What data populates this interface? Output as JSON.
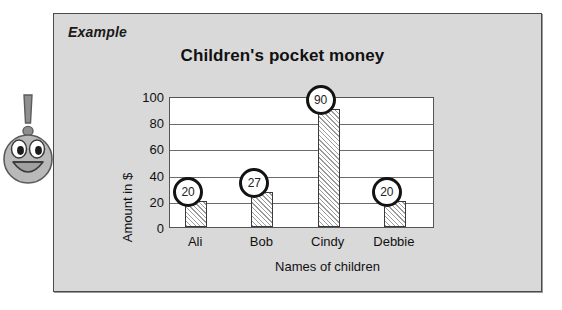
{
  "panel": {
    "example_label": "Example"
  },
  "icon": {
    "name": "exclamation-smiley-icon"
  },
  "chart_data": {
    "type": "bar",
    "title": "Children's pocket money",
    "xlabel": "Names of children",
    "ylabel": "Amount in $",
    "categories": [
      "Ali",
      "Bob",
      "Cindy",
      "Debbie"
    ],
    "values": [
      20,
      27,
      90,
      20
    ],
    "value_labels": [
      "20",
      "27",
      "90",
      "20"
    ],
    "ylim": [
      0,
      100
    ],
    "yticks": [
      0,
      20,
      40,
      60,
      80,
      100
    ],
    "ytick_labels": [
      "0",
      "20",
      "40",
      "60",
      "80",
      "100"
    ],
    "grid": true,
    "legend": false,
    "bar_fill": "#f2f2f2",
    "bar_hatch": "diagonal",
    "plot_background": "#ffffff",
    "panel_background": "#d9d9d9",
    "annotation_style": "circled-value"
  }
}
